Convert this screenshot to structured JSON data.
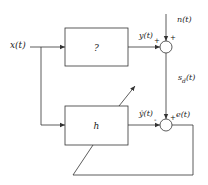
{
  "diagram": {
    "type": "adaptive system identification block diagram",
    "colors": {
      "line": "#333333",
      "background": "#ffffff",
      "text": "#222222"
    },
    "blocks": [
      {
        "id": "unknown-system",
        "label": "?"
      },
      {
        "id": "adaptive-filter",
        "label": "h"
      }
    ],
    "signals": {
      "input": "x(t)",
      "unknown_output": "y(t)",
      "noise": "n(t)",
      "desired": "s",
      "desired_sub": "d",
      "desired_arg": "(t)",
      "estimate": "ŷ(t)",
      "error": "e(t)"
    },
    "summing_junctions": [
      {
        "id": "sum-top",
        "signs": {
          "left": "+",
          "top": "+"
        }
      },
      {
        "id": "sum-bottom",
        "signs": {
          "left": "-",
          "top": "+"
        }
      }
    ]
  }
}
